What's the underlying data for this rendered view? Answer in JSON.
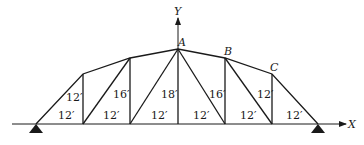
{
  "diagram": {
    "type": "truss",
    "axes": {
      "x_label": "X",
      "y_label": "Y"
    },
    "nodes": {
      "A": "A",
      "B": "B",
      "C": "C"
    },
    "panel_widths": [
      "12′",
      "12′",
      "12′",
      "12′",
      "12′",
      "12′"
    ],
    "vertical_heights": [
      "12′",
      "16′",
      "18′",
      "16′",
      "12′"
    ],
    "colors": {
      "line": "#1a1a1a",
      "background": "#ffffff"
    }
  }
}
